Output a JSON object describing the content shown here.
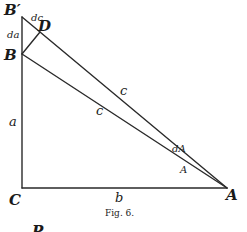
{
  "figure": {
    "caption": "Fig. 6.",
    "stroke_color": "#2a2a2a",
    "points": {
      "B_prime": {
        "label": "B′",
        "x": 22,
        "y": 17
      },
      "D": {
        "label": "D",
        "x": 40,
        "y": 32
      },
      "B": {
        "label": "B",
        "x": 22,
        "y": 54
      },
      "C": {
        "label": "C",
        "x": 22,
        "y": 188
      },
      "A": {
        "label": "A",
        "x": 227,
        "y": 188
      }
    },
    "segment_labels": {
      "dc": "dc",
      "da": "da",
      "a": "a",
      "c_outer": "c",
      "c_inner": "c",
      "b": "b",
      "dA": "dA",
      "angle_A": "A"
    },
    "footer_partial": "P"
  }
}
